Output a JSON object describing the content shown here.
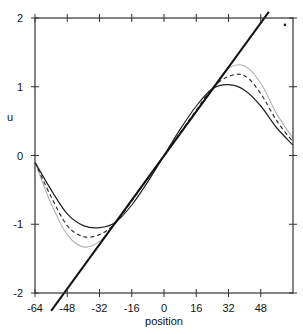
{
  "chart_data": {
    "type": "line",
    "title": "",
    "xlabel": "position",
    "ylabel": "u",
    "xlim": [
      -64,
      64
    ],
    "ylim": [
      -2,
      2
    ],
    "grid": false,
    "legend": null,
    "x_ticks": [
      -64,
      -48,
      -32,
      -16,
      0,
      16,
      32,
      48
    ],
    "x_tick_labels": [
      "-64",
      "-48",
      "-32",
      "-16",
      "0",
      "16",
      "32",
      "48"
    ],
    "y_ticks": [
      -2,
      -1,
      0,
      1,
      2
    ],
    "y_tick_labels": [
      "-2",
      "-1",
      "0",
      "1",
      "2"
    ],
    "series": [
      {
        "name": "straight line",
        "style": "solid-thick",
        "color": "#111111",
        "x": [
          -56,
          52
        ],
        "y": [
          -2.26,
          2.09
        ]
      },
      {
        "name": "solid curve",
        "style": "solid",
        "color": "#222222",
        "x": [
          -64,
          -56,
          -48,
          -40,
          -32,
          -24,
          -16,
          -8,
          0,
          8,
          16,
          24,
          32,
          40,
          48,
          56,
          64
        ],
        "y": [
          -0.1,
          -0.5,
          -0.85,
          -1.02,
          -1.05,
          -0.97,
          -0.72,
          -0.38,
          0.0,
          0.38,
          0.72,
          0.97,
          1.03,
          0.95,
          0.72,
          0.4,
          0.15
        ]
      },
      {
        "name": "dashed curve",
        "style": "dashed",
        "color": "#333333",
        "x": [
          -64,
          -56,
          -48,
          -40,
          -32,
          -24,
          -16,
          -8,
          0,
          8,
          16,
          24,
          32,
          40,
          48,
          56,
          64
        ],
        "y": [
          -0.1,
          -0.6,
          -1.02,
          -1.18,
          -1.15,
          -0.98,
          -0.66,
          -0.33,
          0.0,
          0.33,
          0.66,
          0.98,
          1.15,
          1.16,
          0.9,
          0.5,
          0.2
        ]
      },
      {
        "name": "gray curve",
        "style": "solid-light",
        "color": "#b0b0b0",
        "x": [
          -64,
          -56,
          -48,
          -40,
          -32,
          -24,
          -16,
          -8,
          0,
          8,
          16,
          24,
          32,
          40,
          48,
          56,
          64
        ],
        "y": [
          -0.1,
          -0.7,
          -1.15,
          -1.33,
          -1.25,
          -0.98,
          -0.64,
          -0.32,
          0.0,
          0.32,
          0.64,
          0.98,
          1.27,
          1.3,
          1.05,
          0.6,
          0.25
        ]
      }
    ],
    "annotations": [
      {
        "type": "dot",
        "x": 60,
        "y": 1.9
      }
    ]
  }
}
